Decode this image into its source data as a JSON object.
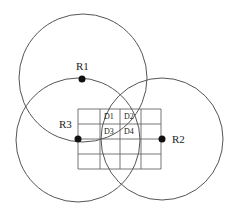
{
  "diagram": {
    "type": "trilateration",
    "circles": [
      {
        "id": "c1",
        "cx": 83,
        "cy": 78,
        "r": 64
      },
      {
        "id": "c2",
        "cx": 162,
        "cy": 139,
        "r": 61
      },
      {
        "id": "c3",
        "cx": 78,
        "cy": 140,
        "r": 62
      }
    ],
    "nodes": [
      {
        "id": "R1",
        "label": "R1",
        "x": 82,
        "y": 79,
        "lx": 76,
        "ly": 69
      },
      {
        "id": "R2",
        "label": "R2",
        "x": 162,
        "y": 139,
        "lx": 172,
        "ly": 143
      },
      {
        "id": "R3",
        "label": "R3",
        "x": 78,
        "y": 139,
        "lx": 59,
        "ly": 128
      }
    ],
    "grid": {
      "xs": [
        78,
        100,
        120,
        141,
        161
      ],
      "ys": [
        109,
        124,
        139,
        154,
        169
      ]
    },
    "cells": [
      {
        "label": "D1",
        "x": 104,
        "y": 119
      },
      {
        "label": "D2",
        "x": 125,
        "y": 119
      },
      {
        "label": "D3",
        "x": 104,
        "y": 134
      },
      {
        "label": "D4",
        "x": 125,
        "y": 134
      }
    ],
    "colors": {
      "stroke": "#555555",
      "node": "#111111"
    }
  },
  "labels": {
    "R1": "R1",
    "R2": "R2",
    "R3": "R3",
    "D1": "D1",
    "D2": "D2",
    "D3": "D3",
    "D4": "D4"
  }
}
